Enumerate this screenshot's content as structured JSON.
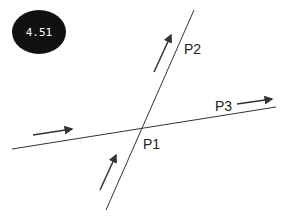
{
  "badge": {
    "value": "4.51"
  },
  "labels": {
    "p1": "P1",
    "p2": "P2",
    "p3": "P3"
  },
  "colors": {
    "line": "#333333",
    "badge_bg": "#111111",
    "badge_text": "#ffffff"
  }
}
